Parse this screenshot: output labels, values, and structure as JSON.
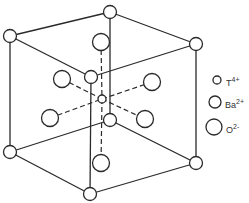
{
  "diagram": {
    "type": "perovskite-unit-cell",
    "legend": [
      {
        "symbol": "T",
        "charge": "4+",
        "size": "small"
      },
      {
        "symbol": "Ba",
        "charge": "2+",
        "size": "medium"
      },
      {
        "symbol": "O",
        "charge": "2-",
        "size": "large"
      }
    ],
    "colors": {
      "line": "#2a2a2a",
      "atom_fill": "#ffffff"
    }
  }
}
